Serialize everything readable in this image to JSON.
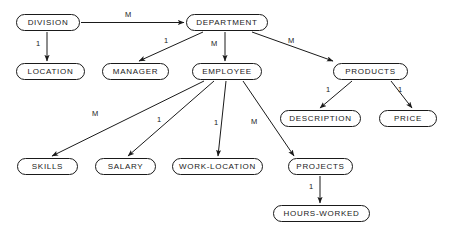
{
  "diagram": {
    "type": "hierarchical-entity-diagram",
    "notation": "arrows labeled with cardinality 1 or M",
    "canvas": {
      "width": 450,
      "height": 239
    },
    "colors": {
      "background": "#ffffff",
      "node_border": "#1a1a1a",
      "node_fill": "#ffffff",
      "text": "#1a1a1a",
      "edge": "#1a1a1a"
    },
    "nodes": [
      {
        "id": "division",
        "label": "DIVISION",
        "x": 16,
        "y": 14,
        "w": 64,
        "h": 17
      },
      {
        "id": "department",
        "label": "DEPARTMENT",
        "x": 186,
        "y": 14,
        "w": 82,
        "h": 17
      },
      {
        "id": "location",
        "label": "LOCATION",
        "x": 16,
        "y": 63,
        "w": 69,
        "h": 17
      },
      {
        "id": "manager",
        "label": "MANAGER",
        "x": 102,
        "y": 63,
        "w": 67,
        "h": 17
      },
      {
        "id": "employee",
        "label": "EMPLOYEE",
        "x": 192,
        "y": 63,
        "w": 70,
        "h": 17
      },
      {
        "id": "products",
        "label": "PRODUCTS",
        "x": 333,
        "y": 63,
        "w": 75,
        "h": 17
      },
      {
        "id": "description",
        "label": "DESCRIPTION",
        "x": 280,
        "y": 110,
        "w": 81,
        "h": 17
      },
      {
        "id": "price",
        "label": "PRICE",
        "x": 379,
        "y": 110,
        "w": 58,
        "h": 17
      },
      {
        "id": "skills",
        "label": "SKILLS",
        "x": 17,
        "y": 158,
        "w": 61,
        "h": 17
      },
      {
        "id": "salary",
        "label": "SALARY",
        "x": 95,
        "y": 158,
        "w": 61,
        "h": 17
      },
      {
        "id": "work_location",
        "label": "WORK-LOCATION",
        "x": 172,
        "y": 158,
        "w": 91,
        "h": 17
      },
      {
        "id": "projects",
        "label": "PROJECTS",
        "x": 288,
        "y": 158,
        "w": 65,
        "h": 17
      },
      {
        "id": "hours_worked",
        "label": "HOURS-WORKED",
        "x": 273,
        "y": 205,
        "w": 97,
        "h": 17
      }
    ],
    "edges": [
      {
        "id": "e1",
        "from": "division",
        "to": "department",
        "cardinality": "M",
        "label_x": 125,
        "label_y": 11
      },
      {
        "id": "e2",
        "from": "division",
        "to": "location",
        "cardinality": "1",
        "label_x": 36,
        "label_y": 40
      },
      {
        "id": "e3",
        "from": "department",
        "to": "manager",
        "cardinality": "1",
        "label_x": 164,
        "label_y": 37
      },
      {
        "id": "e4",
        "from": "department",
        "to": "employee",
        "cardinality": "M",
        "label_x": 211,
        "label_y": 40
      },
      {
        "id": "e5",
        "from": "department",
        "to": "products",
        "cardinality": "M",
        "label_x": 288,
        "label_y": 37
      },
      {
        "id": "e6",
        "from": "products",
        "to": "description",
        "cardinality": "1",
        "label_x": 326,
        "label_y": 86
      },
      {
        "id": "e7",
        "from": "products",
        "to": "price",
        "cardinality": "1",
        "label_x": 398,
        "label_y": 86
      },
      {
        "id": "e8",
        "from": "employee",
        "to": "skills",
        "cardinality": "M",
        "label_x": 92,
        "label_y": 110
      },
      {
        "id": "e9",
        "from": "employee",
        "to": "salary",
        "cardinality": "1",
        "label_x": 157,
        "label_y": 116
      },
      {
        "id": "e10",
        "from": "employee",
        "to": "work_location",
        "cardinality": "1",
        "label_x": 214,
        "label_y": 119
      },
      {
        "id": "e11",
        "from": "employee",
        "to": "projects",
        "cardinality": "M",
        "label_x": 251,
        "label_y": 118
      },
      {
        "id": "e12",
        "from": "projects",
        "to": "hours_worked",
        "cardinality": "1",
        "label_x": 309,
        "label_y": 183
      }
    ]
  }
}
